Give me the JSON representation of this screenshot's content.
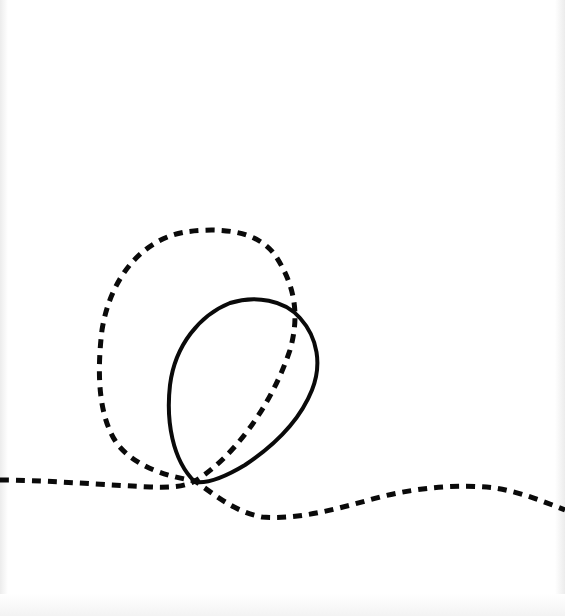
{
  "canvas": {
    "width": 565,
    "height": 616,
    "background": "#ffffff"
  },
  "drawing": {
    "description": "Hand-drawn line sketch: a dashed curve forming a large loop, crossed by a solid closed oval loop",
    "stroke_color": "#0a0a0a",
    "shapes": [
      {
        "name": "dashed-loop-curve",
        "style": "dashed",
        "stroke_width": 5,
        "dash": "9 7",
        "path": "M 0 480 C 40 480, 90 484, 150 487 C 175 488, 185 486, 195 481 C 230 460, 270 410, 290 350 C 300 315, 295 285, 275 255 C 255 228, 215 228, 185 232 C 140 240, 110 280, 102 330 C 96 380, 100 420, 118 445 C 135 465, 160 475, 195 481 C 215 495, 235 512, 262 517 C 300 520, 340 508, 380 497 C 420 487, 460 484, 495 488 C 520 492, 545 502, 565 510"
      },
      {
        "name": "solid-oval-loop",
        "style": "solid",
        "stroke_width": 4,
        "path": "M 195 482 C 172 460, 166 420, 170 385 C 175 345, 200 315, 230 303 C 255 295, 285 300, 300 318 C 318 338, 322 365, 312 390 C 300 420, 275 445, 245 465 C 225 477, 208 484, 195 482 Z"
      }
    ],
    "crossing_point": {
      "x": 195,
      "y": 482
    }
  }
}
